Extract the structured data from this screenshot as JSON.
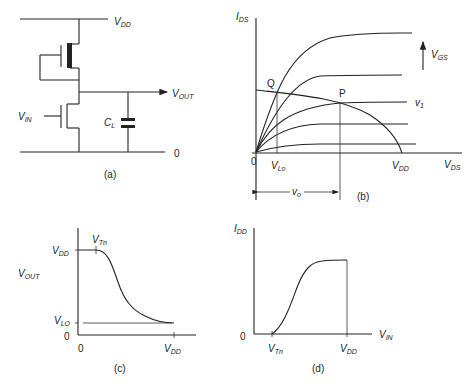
{
  "panels": {
    "a": {
      "label": "(a)",
      "vdd": "V",
      "vdd_sub": "DD",
      "vout": "V",
      "vout_sub": "OUT",
      "vin": "V",
      "vin_sub": "IN",
      "cl": "C",
      "cl_sub": "L",
      "ground": "0"
    },
    "b": {
      "label": "(b)",
      "y_axis": "I",
      "y_axis_sub": "DS",
      "x_axis": "V",
      "x_axis_sub": "DS",
      "vgs_arrow": "V",
      "vgs_arrow_sub": "GS",
      "point_q": "Q",
      "point_p": "P",
      "curve_v1": "v",
      "curve_v1_sub": "1",
      "origin": "0",
      "vlo": "V",
      "vlo_sub": "Lo",
      "vdd": "V",
      "vdd_sub": "DD",
      "vo": "v",
      "vo_sub": "o"
    },
    "c": {
      "label": "(c)",
      "y_axis": "V",
      "y_axis_sub": "OUT",
      "vdd_y": "V",
      "vdd_y_sub": "DD",
      "vtn": "V",
      "vtn_sub": "Tn",
      "vlo": "V",
      "vlo_sub": "LO",
      "origin_y": "0",
      "origin_x": "0",
      "vdd_x": "V",
      "vdd_x_sub": "DD"
    },
    "d": {
      "label": "(d)",
      "y_axis": "I",
      "y_axis_sub": "DD",
      "x_axis": "V",
      "x_axis_sub": "IN",
      "origin": "0",
      "vtn": "V",
      "vtn_sub": "Tn",
      "vdd": "V",
      "vdd_sub": "DD"
    }
  }
}
